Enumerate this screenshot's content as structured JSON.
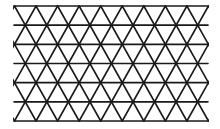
{
  "diagram": {
    "type": "triangular-lattice",
    "bounds": {
      "x0": 14,
      "y0": 6,
      "x1": 208,
      "y1": 121
    },
    "horizontal_lines": 7,
    "row_spacing": 19.2,
    "vertex_spacing": 21.55,
    "top_row_offset_x": 14.5,
    "alt_row_offset_x": 25.3,
    "stroke_color": "#1a1a1a",
    "background_color": "#ffffff",
    "stroke_width": 1.6
  }
}
